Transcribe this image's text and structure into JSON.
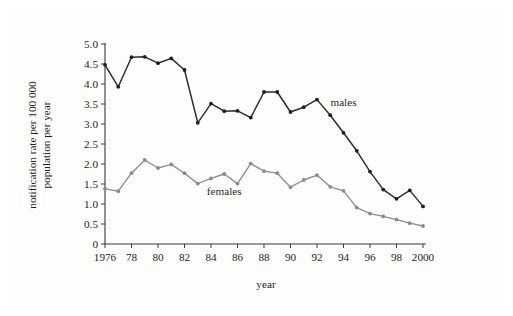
{
  "figure": {
    "background_color": "#ffffff",
    "panel_color": "#fdfdfb"
  },
  "chart_data": {
    "type": "line",
    "title": "",
    "subtitle": "",
    "xlabel": "year",
    "ylabel": "notification rate per 100 000 population per year",
    "ylabel_line1": "notification rate per 100 000",
    "ylabel_line2": "population per year",
    "xlim": [
      1976,
      2000
    ],
    "ylim": [
      0,
      5.0
    ],
    "grid": false,
    "legend_position": "inline-annotation",
    "x": [
      1976,
      1977,
      1978,
      1979,
      1980,
      1981,
      1982,
      1983,
      1984,
      1985,
      1986,
      1987,
      1988,
      1989,
      1990,
      1991,
      1992,
      1993,
      1994,
      1995,
      1996,
      1997,
      1998,
      1999,
      2000
    ],
    "xticks": [
      1976,
      1978,
      1980,
      1982,
      1984,
      1986,
      1988,
      1990,
      1992,
      1994,
      1996,
      1998,
      2000
    ],
    "xticklabels": [
      "1976",
      "78",
      "80",
      "82",
      "84",
      "86",
      "88",
      "90",
      "92",
      "94",
      "96",
      "98",
      "2000"
    ],
    "yticks": [
      0,
      0.5,
      1.0,
      1.5,
      2.0,
      2.5,
      3.0,
      3.5,
      4.0,
      4.5,
      5.0
    ],
    "yticklabels": [
      "0",
      "0.5",
      "1.0",
      "1.5",
      "2.0",
      "2.5",
      "3.0",
      "3.5",
      "4.0",
      "4.5",
      "5.0"
    ],
    "series": [
      {
        "name": "males",
        "label": "males",
        "color": "#2b2b2b",
        "marker_color": "#1e1e1e",
        "values": [
          4.48,
          3.93,
          4.67,
          4.68,
          4.52,
          4.64,
          4.35,
          3.03,
          3.51,
          3.32,
          3.33,
          3.16,
          3.8,
          3.8,
          3.3,
          3.42,
          3.61,
          3.22,
          2.78,
          2.33,
          1.81,
          1.36,
          1.13,
          1.34,
          0.94
        ]
      },
      {
        "name": "females",
        "label": "females",
        "color": "#8d8d8d",
        "marker_color": "#8a8a8a",
        "values": [
          1.38,
          1.32,
          1.77,
          2.1,
          1.9,
          1.99,
          1.77,
          1.51,
          1.64,
          1.75,
          1.51,
          2.01,
          1.82,
          1.77,
          1.42,
          1.6,
          1.72,
          1.43,
          1.33,
          0.91,
          0.76,
          0.69,
          0.61,
          0.52,
          0.45
        ]
      }
    ],
    "annotations": [
      {
        "name": "males-label",
        "text": "males",
        "x": 1994.0,
        "y": 3.45
      },
      {
        "name": "females-label",
        "text": "females",
        "x": 1985.0,
        "y": 1.22
      }
    ]
  }
}
